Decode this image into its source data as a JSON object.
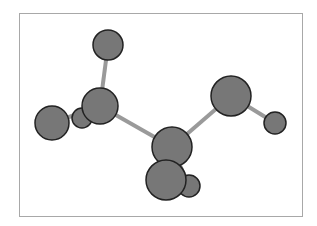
{
  "diagram": {
    "type": "ball-and-stick molecule",
    "colors": {
      "background": "#ffffff",
      "frame": "#a8a8a8",
      "atom_fill": "#777777",
      "atom_stroke": "#222222",
      "bond": "#9a9a9a"
    },
    "atoms": [
      {
        "id": "D",
        "cx": 82,
        "cy": 118,
        "r": 10
      },
      {
        "id": "A",
        "cx": 108,
        "cy": 45,
        "r": 15
      },
      {
        "id": "C",
        "cx": 52,
        "cy": 123,
        "r": 17
      },
      {
        "id": "B",
        "cx": 100,
        "cy": 106,
        "r": 18
      },
      {
        "id": "I",
        "cx": 275,
        "cy": 123,
        "r": 11
      },
      {
        "id": "H",
        "cx": 231,
        "cy": 96,
        "r": 20
      },
      {
        "id": "E",
        "cx": 172,
        "cy": 147,
        "r": 20
      },
      {
        "id": "G",
        "cx": 189,
        "cy": 186,
        "r": 11
      },
      {
        "id": "F",
        "cx": 166,
        "cy": 180,
        "r": 20
      }
    ],
    "bonds": [
      {
        "from": "A",
        "to": "B"
      },
      {
        "from": "B",
        "to": "C"
      },
      {
        "from": "B",
        "to": "D"
      },
      {
        "from": "B",
        "to": "E"
      },
      {
        "from": "E",
        "to": "H"
      },
      {
        "from": "H",
        "to": "I"
      },
      {
        "from": "E",
        "to": "F"
      },
      {
        "from": "E",
        "to": "G"
      }
    ]
  }
}
